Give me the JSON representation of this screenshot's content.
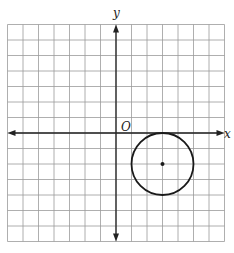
{
  "chart_data": {
    "type": "diagram",
    "title": "",
    "xlabel": "x",
    "ylabel": "y",
    "origin_label": "O",
    "grid": true,
    "xlim": [
      -7,
      7
    ],
    "ylim": [
      -7,
      7
    ],
    "grid_step": 1,
    "shapes": [
      {
        "type": "circle",
        "center": [
          3,
          -2
        ],
        "radius": 2
      }
    ],
    "points": [
      {
        "x": 3,
        "y": -2,
        "label": "center"
      }
    ]
  },
  "labels": {
    "x_axis": "x",
    "y_axis": "y",
    "origin": "O"
  },
  "colors": {
    "grid": "#9a9a9a",
    "axis": "#222222",
    "circle": "#1a1a1a"
  }
}
